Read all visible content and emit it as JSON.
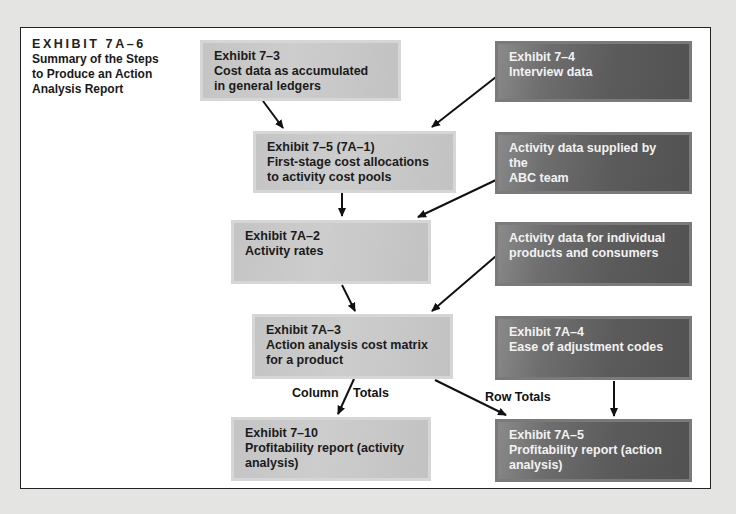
{
  "caption": {
    "exhibit": "EXHIBIT 7A–6",
    "title_lines": [
      "Summary of the Steps",
      "to Produce an Action",
      "Analysis Report"
    ]
  },
  "boxes": {
    "cost_data": {
      "lines": [
        "Exhibit 7–3",
        "Cost data as accumulated",
        "in general ledgers"
      ],
      "shade": "light"
    },
    "interview": {
      "lines": [
        "Exhibit 7–4",
        "Interview data"
      ],
      "shade": "dark"
    },
    "first_stage": {
      "lines": [
        "Exhibit 7–5 (7A–1)",
        "First-stage cost allocations",
        "to activity cost pools"
      ],
      "shade": "light"
    },
    "abc_team": {
      "lines": [
        "Activity data supplied by the",
        "ABC team"
      ],
      "shade": "dark"
    },
    "activity_rates": {
      "lines": [
        "Exhibit 7A–2",
        "Activity rates"
      ],
      "shade": "light"
    },
    "individual_products": {
      "lines": [
        "Activity data for individual",
        "products and consumers"
      ],
      "shade": "dark"
    },
    "cost_matrix": {
      "lines": [
        "Exhibit 7A–3",
        "Action analysis cost matrix",
        "for a product"
      ],
      "shade": "light"
    },
    "ease_codes": {
      "lines": [
        "Exhibit 7A–4",
        "Ease of adjustment codes"
      ],
      "shade": "dark"
    },
    "report_activity": {
      "lines": [
        "Exhibit 7–10",
        "Profitability report (activity",
        "analysis)"
      ],
      "shade": "light"
    },
    "report_action": {
      "lines": [
        "Exhibit 7A–5",
        "Profitability report (action",
        "analysis)"
      ],
      "shade": "dark"
    }
  },
  "labels": {
    "column": "Column",
    "totals": "Totals",
    "row_totals": "Row Totals"
  },
  "edges": [
    {
      "from": "cost_data",
      "to": "first_stage"
    },
    {
      "from": "interview",
      "to": "first_stage"
    },
    {
      "from": "first_stage",
      "to": "activity_rates"
    },
    {
      "from": "abc_team",
      "to": "activity_rates"
    },
    {
      "from": "activity_rates",
      "to": "cost_matrix"
    },
    {
      "from": "individual_products",
      "to": "cost_matrix"
    },
    {
      "from": "cost_matrix",
      "to": "report_activity",
      "label": "Column Totals"
    },
    {
      "from": "cost_matrix",
      "to": "report_action",
      "label": "Row Totals"
    },
    {
      "from": "ease_codes",
      "to": "report_action"
    }
  ],
  "colors": {
    "light_box": "#c8c8c8",
    "dark_box": "#5e5e5e",
    "frame_border": "#222222",
    "background": "#e4e4e2"
  }
}
